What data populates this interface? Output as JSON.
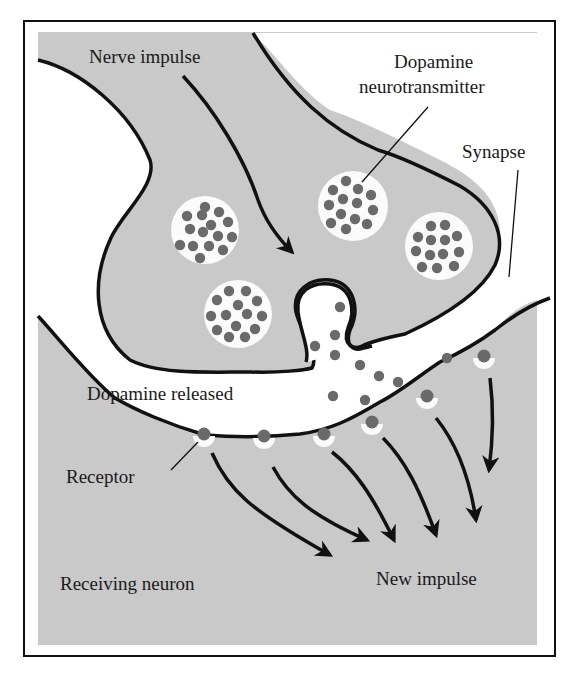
{
  "figure": {
    "labels": {
      "nerve_impulse": "Nerve impulse",
      "dopamine_line1": "Dopamine",
      "dopamine_line2": "neurotransmitter",
      "synapse": "Synapse",
      "dopamine_released": "Dopamine released",
      "receptor": "Receptor",
      "receiving_neuron": "Receiving neuron",
      "new_impulse": "New impulse"
    },
    "colors": {
      "background": "#ffffff",
      "neuron_fill": "#c9c9c9",
      "cleft_fill": "#ffffff",
      "outline": "#111111",
      "dopamine_dot": "#6a6a6a",
      "vesicle_fill": "#fbfbfb"
    },
    "counts": {
      "vesicles": 4,
      "receptors": 6,
      "impulse_arrows": 6
    }
  }
}
